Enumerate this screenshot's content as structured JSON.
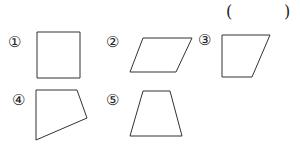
{
  "answer_blank": {
    "open": "(",
    "close": ")"
  },
  "shapes": [
    {
      "label": "①",
      "type": "square",
      "points": "37,32 80,32 80,78 37,78"
    },
    {
      "label": "②",
      "type": "parallelogram",
      "points": "143,38 192,38 176,72 130,72"
    },
    {
      "label": "③",
      "type": "trapezoid",
      "points": "222,35 270,35 252,77 222,77"
    },
    {
      "label": "④",
      "type": "quadrilateral",
      "points": "36,90 77,90 87,118 36,140"
    },
    {
      "label": "⑤",
      "type": "trapezoid",
      "points": "143,91 170,91 182,136 130,136"
    }
  ]
}
